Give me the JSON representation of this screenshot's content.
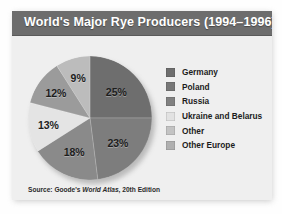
{
  "title": "World's Major Rye Producers (1994–1996)",
  "source": {
    "prefix": "Source: Goode's ",
    "italic": "World Atlas",
    "suffix": ", 20th Edition"
  },
  "legend": {
    "items": [
      {
        "label": "Germany",
        "color": "#6e6e6e"
      },
      {
        "label": "Poland",
        "color": "#777777"
      },
      {
        "label": "Russia",
        "color": "#808080"
      },
      {
        "label": "Ukraine and Belarus",
        "color": "#e2e2e2"
      },
      {
        "label": "Other",
        "color": "#c3c3c3"
      },
      {
        "label": "Other Europe",
        "color": "#b0b0b0"
      }
    ]
  },
  "chart_data": {
    "type": "pie",
    "title": "World's Major Rye Producers (1994–1996)",
    "categories": [
      "Germany",
      "Poland",
      "Russia",
      "Ukraine and Belarus",
      "Other",
      "Other Europe"
    ],
    "values": [
      25,
      23,
      18,
      13,
      12,
      9
    ],
    "labels": [
      "25%",
      "23%",
      "18%",
      "13%",
      "12%",
      "9%"
    ],
    "colors": [
      "#6e6e6e",
      "#7d7d7d",
      "#8a8a8a",
      "#e4e4e4",
      "#9b9b9b",
      "#bcbcbc"
    ],
    "units": "percent",
    "total": 100,
    "start_angle": 0,
    "direction": "clockwise",
    "legend_position": "right",
    "grid": false
  }
}
